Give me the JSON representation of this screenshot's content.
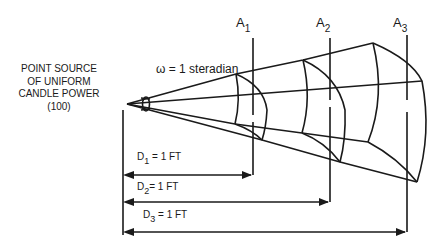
{
  "source_label": {
    "lines": [
      "POINT SOURCE",
      "OF UNIFORM",
      "CANDLE POWER",
      "(100)"
    ]
  },
  "solid_angle": {
    "symbol": "ω",
    "text": "= 1 steradian"
  },
  "areas": [
    {
      "letter": "A",
      "sub": "1"
    },
    {
      "letter": "A",
      "sub": "2"
    },
    {
      "letter": "A",
      "sub": "3"
    }
  ],
  "distances": [
    {
      "letter": "D",
      "sub": "1",
      "value": "= 1 FT"
    },
    {
      "letter": "D",
      "sub": "2",
      "value": "= 1 FT"
    },
    {
      "letter": "D",
      "sub": "3",
      "value": "= 1 FT"
    }
  ],
  "colors": {
    "line": "#1a1a1a",
    "background": "#ffffff"
  }
}
